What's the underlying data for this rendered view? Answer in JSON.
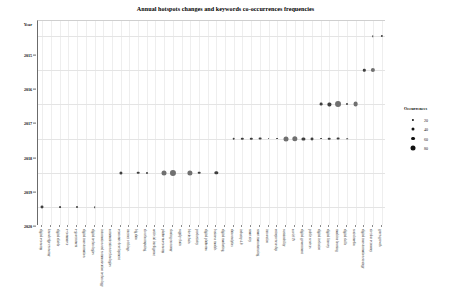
{
  "chart_data": {
    "type": "scatter",
    "title": "Annual hotspots changes and keywords co-occurrences frequencies",
    "xlabel": "Keywords",
    "ylabel": "Year",
    "grid": true,
    "legend": {
      "title": "Occurrences",
      "position": "right",
      "entries": [
        {
          "label": "20",
          "size": 2.2
        },
        {
          "label": "40",
          "size": 3.0
        },
        {
          "label": "60",
          "size": 3.9
        },
        {
          "label": "80",
          "size": 5.0
        }
      ]
    },
    "y_categories": [
      "2015",
      "2016",
      "2017",
      "2018",
      "2019",
      "2020"
    ],
    "categories": [
      "digital economy",
      "knowledge economy",
      "digital divide",
      "e-commerce",
      "e-government",
      "digital transformation",
      "digital technologies",
      "information and communication technology",
      "communication technologies",
      "economic development",
      "internet of things",
      "big data",
      "cloud computing",
      "artificial intelligence",
      "platform economy",
      "sharing economy",
      "supply chain",
      "blockchain",
      "productivity",
      "digital platforms",
      "business models",
      "digital marketing",
      "data analytics",
      "industry 4.0",
      "smart city",
      "smart manufacturing",
      "innovation",
      "entrepreneurship",
      "sustainability",
      "covid-19",
      "digital government",
      "public services",
      "digital inclusion",
      "digital literacy",
      "machine learning",
      "digital skills",
      "social media",
      "digital transformation strategy",
      "circular economy",
      "green growth"
    ],
    "points": [
      {
        "x": 0,
        "y": "2020",
        "value": 26
      },
      {
        "x": 2,
        "y": "2020",
        "value": 14
      },
      {
        "x": 4,
        "y": "2020",
        "value": 16
      },
      {
        "x": 6,
        "y": "2020",
        "value": 12
      },
      {
        "x": 9,
        "y": "2019",
        "value": 28
      },
      {
        "x": 11,
        "y": "2019",
        "value": 22
      },
      {
        "x": 12,
        "y": "2019",
        "value": 15
      },
      {
        "x": 14,
        "y": "2019",
        "value": 48
      },
      {
        "x": 15,
        "y": "2019",
        "value": 60
      },
      {
        "x": 17,
        "y": "2019",
        "value": 50
      },
      {
        "x": 18,
        "y": "2019",
        "value": 22
      },
      {
        "x": 20,
        "y": "2019",
        "value": 30
      },
      {
        "x": 22,
        "y": "2018",
        "value": 22
      },
      {
        "x": 23,
        "y": "2018",
        "value": 20
      },
      {
        "x": 24,
        "y": "2018",
        "value": 20
      },
      {
        "x": 25,
        "y": "2018",
        "value": 24
      },
      {
        "x": 26,
        "y": "2018",
        "value": 14
      },
      {
        "x": 27,
        "y": "2018",
        "value": 14
      },
      {
        "x": 28,
        "y": "2018",
        "value": 48
      },
      {
        "x": 29,
        "y": "2018",
        "value": 52
      },
      {
        "x": 30,
        "y": "2018",
        "value": 28
      },
      {
        "x": 31,
        "y": "2018",
        "value": 26
      },
      {
        "x": 32,
        "y": "2018",
        "value": 14
      },
      {
        "x": 33,
        "y": "2018",
        "value": 22
      },
      {
        "x": 34,
        "y": "2018",
        "value": 24
      },
      {
        "x": 35,
        "y": "2018",
        "value": 12
      },
      {
        "x": 32,
        "y": "2017",
        "value": 24
      },
      {
        "x": 33,
        "y": "2017",
        "value": 28
      },
      {
        "x": 34,
        "y": "2017",
        "value": 58
      },
      {
        "x": 35,
        "y": "2017",
        "value": 16
      },
      {
        "x": 36,
        "y": "2017",
        "value": 46
      },
      {
        "x": 37,
        "y": "2016",
        "value": 20
      },
      {
        "x": 38,
        "y": "2016",
        "value": 40
      },
      {
        "x": 38,
        "y": "2015",
        "value": 10
      },
      {
        "x": 39,
        "y": "2015",
        "value": 18
      }
    ]
  }
}
